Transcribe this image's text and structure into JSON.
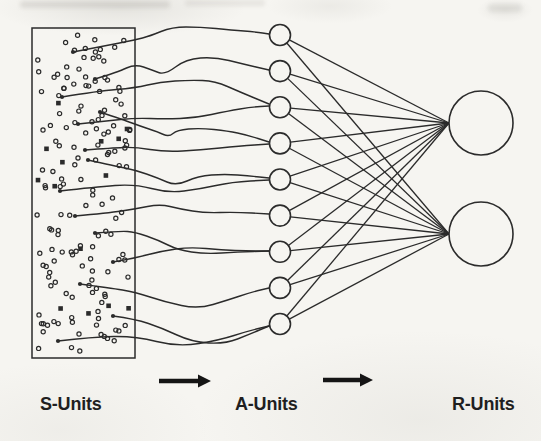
{
  "figure": {
    "width": 541,
    "height": 441,
    "bg_color": "#f6f5f1",
    "ink_color": "#2b2b2b"
  },
  "labels": {
    "s_units": "S-Units",
    "a_units": "A-Units",
    "r_units": "R-Units"
  },
  "layers": {
    "s_panel": {
      "x": 32,
      "y": 28,
      "width": 103,
      "height": 330,
      "hollow_dot_count": 150,
      "filled_square_count": 14,
      "random_seed": 1337,
      "dot_radius": 2.1,
      "square_size": 4.6,
      "dot_margin": 5
    },
    "a_units": {
      "count": 9,
      "cx": 280,
      "cy_first": 35,
      "cy_last": 324,
      "radius": 10.5
    },
    "r_units": {
      "cx": 481,
      "radius": 32,
      "cys": [
        123,
        234
      ]
    },
    "flow_arrows": [
      {
        "x": 159,
        "y": 381,
        "length": 52
      },
      {
        "x": 323,
        "y": 380,
        "length": 50
      }
    ]
  },
  "connections": {
    "a_to_r": {
      "type": "complete-bipartite",
      "a_count": 9,
      "r_count": 2
    },
    "s_to_a": [
      {
        "to_a_unit": 0,
        "points": [
          [
            73,
            52
          ],
          [
            104,
            46
          ],
          [
            135,
            40
          ],
          [
            150,
            36
          ],
          [
            172,
            27
          ],
          [
            200,
            27
          ],
          [
            232,
            30
          ],
          [
            256,
            32
          ],
          [
            269,
            34
          ]
        ]
      },
      {
        "to_a_unit": 1,
        "points": [
          [
            95,
            79
          ],
          [
            118,
            72
          ],
          [
            135,
            64
          ],
          [
            152,
            70
          ],
          [
            165,
            75
          ],
          [
            186,
            59
          ],
          [
            215,
            57
          ],
          [
            243,
            64
          ],
          [
            269,
            70
          ]
        ]
      },
      {
        "to_a_unit": 2,
        "points": [
          [
            62,
            97
          ],
          [
            98,
            91
          ],
          [
            135,
            88
          ],
          [
            160,
            82
          ],
          [
            190,
            80
          ],
          [
            215,
            81
          ],
          [
            240,
            92
          ],
          [
            269,
            104
          ]
        ]
      },
      {
        "to_a_unit": 2,
        "points": [
          [
            78,
            124
          ],
          [
            106,
            121
          ],
          [
            135,
            118
          ],
          [
            165,
            119
          ],
          [
            195,
            118
          ],
          [
            228,
            111
          ],
          [
            252,
            107
          ],
          [
            269,
            106
          ]
        ]
      },
      {
        "to_a_unit": 3,
        "points": [
          [
            100,
            112
          ],
          [
            124,
            120
          ],
          [
            140,
            126
          ],
          [
            158,
            132
          ],
          [
            169,
            137
          ],
          [
            177,
            130
          ],
          [
            200,
            128
          ],
          [
            228,
            131
          ],
          [
            247,
            135
          ],
          [
            269,
            142
          ]
        ]
      },
      {
        "to_a_unit": 3,
        "points": [
          [
            85,
            150
          ],
          [
            112,
            148
          ],
          [
            135,
            147
          ],
          [
            165,
            152
          ],
          [
            200,
            150
          ],
          [
            240,
            146
          ],
          [
            269,
            144
          ]
        ]
      },
      {
        "to_a_unit": 4,
        "points": [
          [
            88,
            160
          ],
          [
            115,
            166
          ],
          [
            135,
            170
          ],
          [
            158,
            178
          ],
          [
            176,
            186
          ],
          [
            198,
            176
          ],
          [
            225,
            174
          ],
          [
            250,
            176
          ],
          [
            269,
            178
          ]
        ]
      },
      {
        "to_a_unit": 4,
        "points": [
          [
            60,
            191
          ],
          [
            95,
            187
          ],
          [
            135,
            184
          ],
          [
            168,
            193
          ],
          [
            200,
            189
          ],
          [
            232,
            182
          ],
          [
            269,
            180
          ]
        ]
      },
      {
        "to_a_unit": 5,
        "points": [
          [
            75,
            216
          ],
          [
            108,
            213
          ],
          [
            135,
            209
          ],
          [
            160,
            204
          ],
          [
            180,
            209
          ],
          [
            205,
            213
          ],
          [
            235,
            212
          ],
          [
            269,
            214
          ]
        ]
      },
      {
        "to_a_unit": 6,
        "points": [
          [
            95,
            233
          ],
          [
            120,
            231
          ],
          [
            135,
            232
          ],
          [
            158,
            240
          ],
          [
            178,
            250
          ],
          [
            205,
            254
          ],
          [
            238,
            252
          ],
          [
            269,
            251
          ]
        ]
      },
      {
        "to_a_unit": 6,
        "points": [
          [
            113,
            262
          ],
          [
            135,
            258
          ],
          [
            162,
            251
          ],
          [
            190,
            247
          ],
          [
            222,
            250
          ],
          [
            248,
            251
          ],
          [
            269,
            251
          ]
        ]
      },
      {
        "to_a_unit": 7,
        "points": [
          [
            80,
            284
          ],
          [
            110,
            288
          ],
          [
            135,
            292
          ],
          [
            165,
            302
          ],
          [
            198,
            309
          ],
          [
            228,
            300
          ],
          [
            252,
            292
          ],
          [
            269,
            288
          ]
        ]
      },
      {
        "to_a_unit": 8,
        "points": [
          [
            113,
            316
          ],
          [
            135,
            319
          ],
          [
            162,
            328
          ],
          [
            192,
            342
          ],
          [
            225,
            344
          ],
          [
            250,
            334
          ],
          [
            269,
            326
          ]
        ]
      },
      {
        "to_a_unit": 8,
        "points": [
          [
            58,
            341
          ],
          [
            92,
            337
          ],
          [
            135,
            336
          ],
          [
            178,
            347
          ],
          [
            220,
            340
          ],
          [
            248,
            331
          ],
          [
            269,
            326
          ]
        ]
      }
    ]
  }
}
